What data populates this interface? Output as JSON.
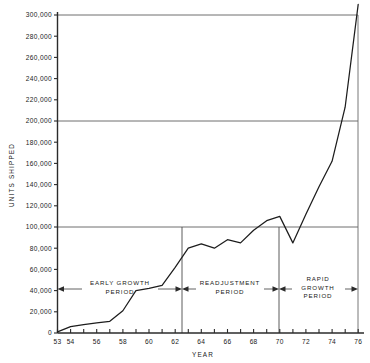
{
  "chart_data": {
    "type": "line",
    "title": "",
    "xlabel": "YEAR",
    "ylabel": "UNITS SHIPPED",
    "xlim": [
      53,
      76
    ],
    "ylim": [
      0,
      310000
    ],
    "grid": "horizontal gridlines at 100,000 / 200,000 / 300,000",
    "legend": "none",
    "x_tick_labels": [
      "53",
      "54",
      "56",
      "58",
      "60",
      "62",
      "64",
      "66",
      "68",
      "70",
      "72",
      "74",
      "76"
    ],
    "x_tick_values": [
      53,
      54,
      56,
      58,
      60,
      62,
      64,
      66,
      68,
      70,
      72,
      74,
      76
    ],
    "x_minor_ticks": [
      53,
      54,
      55,
      56,
      57,
      58,
      59,
      60,
      61,
      62,
      63,
      64,
      65,
      66,
      67,
      68,
      69,
      70,
      71,
      72,
      73,
      74,
      75,
      76
    ],
    "y_tick_labels": [
      "0",
      "20,000",
      "40,000",
      "60,000",
      "80,000",
      "100,000",
      "120,000",
      "140,000",
      "160,000",
      "180,000",
      "200,000",
      "220,000",
      "240,000",
      "260,000",
      "280,000",
      "300,000"
    ],
    "y_tick_values": [
      0,
      20000,
      40000,
      60000,
      80000,
      100000,
      120000,
      140000,
      160000,
      180000,
      200000,
      220000,
      240000,
      260000,
      280000,
      300000
    ],
    "gridline_values": [
      100000,
      200000,
      300000
    ],
    "series": [
      {
        "name": "Units shipped",
        "x": [
          53,
          54,
          55,
          56,
          57,
          58,
          59,
          60,
          61,
          62,
          63,
          64,
          65,
          66,
          67,
          68,
          69,
          70,
          71,
          72,
          73,
          74,
          75,
          76
        ],
        "values": [
          1000,
          6000,
          8000,
          9500,
          11000,
          21000,
          40000,
          42000,
          45000,
          62000,
          80000,
          84000,
          80000,
          88000,
          85000,
          97000,
          106000,
          110000,
          85000,
          112000,
          138000,
          162000,
          213000,
          310000
        ]
      }
    ],
    "period_annotations": [
      {
        "label_lines": [
          "EARLY GROWTH",
          "PERIOD"
        ],
        "start_year": 53,
        "end_year": 63
      },
      {
        "label_lines": [
          "READJUSTMENT",
          "PERIOD"
        ],
        "start_year": 63,
        "end_year": 71
      },
      {
        "label_lines": [
          "RAPID",
          "GROWTH",
          "PERIOD"
        ],
        "start_year": 71,
        "end_year": 76
      }
    ],
    "divider_years": [
      63,
      71
    ]
  }
}
